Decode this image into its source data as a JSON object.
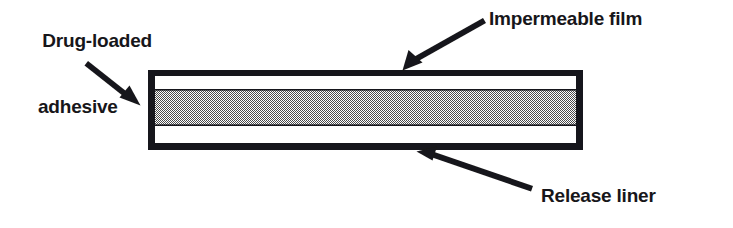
{
  "figure": {
    "background_color": "#ffffff",
    "ink_color": "#17161a",
    "width": 733,
    "height": 228
  },
  "labels": {
    "drug_adhesive": {
      "line1": "Drug-loaded",
      "line2": "adhesive"
    },
    "impermeable_film": "Impermeable film",
    "release_liner": "Release liner"
  },
  "diagram": {
    "outline_color": "#17161a",
    "layers": [
      {
        "name": "impermeable-film",
        "fill": "#17161a",
        "kind": "border"
      },
      {
        "name": "upper-void",
        "fill": "#ffffff",
        "kind": "band"
      },
      {
        "name": "drug-loaded-adhesive",
        "fill": "#a8a8a8",
        "kind": "hatched-band"
      },
      {
        "name": "lower-void",
        "fill": "#ffffff",
        "kind": "band"
      },
      {
        "name": "release-liner",
        "fill": "#17161a",
        "kind": "border"
      }
    ]
  },
  "annotations": [
    {
      "name": "arrow-to-drug-adhesive",
      "points_to": "drug-loaded-adhesive",
      "direction": "down-right"
    },
    {
      "name": "arrow-to-impermeable-film",
      "points_to": "impermeable-film",
      "direction": "down-left"
    },
    {
      "name": "arrow-to-release-liner",
      "points_to": "release-liner",
      "direction": "up-left"
    }
  ]
}
